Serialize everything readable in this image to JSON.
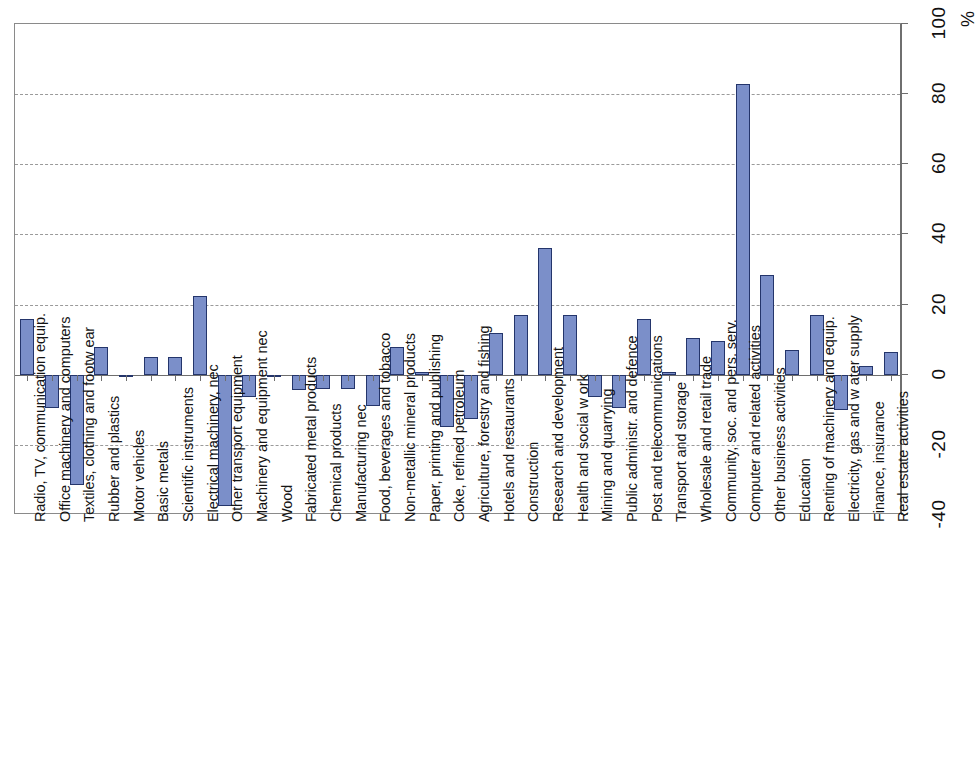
{
  "chart_data": {
    "type": "bar",
    "title": "",
    "subtitle": "",
    "xlabel": "",
    "ylabel": "%",
    "unit_label": "%",
    "ylim": [
      -40,
      100
    ],
    "ytick_values": [
      -40,
      -20,
      0,
      20,
      40,
      60,
      80,
      100
    ],
    "ytick_labels": [
      "-40",
      "-20",
      "0",
      "20",
      "40",
      "60",
      "80",
      "100"
    ],
    "grid": true,
    "grid_axis": "y",
    "legend": false,
    "legend_position": "none",
    "orientation": "vertical",
    "category_label_rotation": -90,
    "value_label_rotation": -90,
    "bar_fill_color": "#7b8fc9",
    "bar_border_color": "#24356b",
    "gridline_color": "#9a9a9a",
    "axis_color": "#6e6e6e",
    "background_color": "#ffffff",
    "categories": [
      "Radio, TV, communication equip.",
      "Office machinery and computers",
      "Textiles, clothing and footw ear",
      "Rubber and plastics",
      "Motor vehicles",
      "Basic metals",
      "Scientific instruments",
      "Electrical machinery, nec",
      "Other transport equipment",
      "Machinery and equipment nec",
      "Wood",
      "Fabricated metal products",
      "Chemical products",
      "Manufacturing nec",
      "Food, beverages and tobacco",
      "Non-metallic mineral products",
      "Paper, printing and publishing",
      "Coke, refined petroleum",
      "Agriculture, forestry and fishing",
      "Hotels and restaurants",
      "Construction",
      "Research and development",
      "Health and social w ork",
      "Mining and quarrying",
      "Public administr. and defence",
      "Post and telecommunications",
      "Transport and storage",
      "Wholesale and retail trade",
      "Community, soc. and pers. serv.",
      "Computer and related activities",
      "Other business activities",
      "Education",
      "Renting of machinery and equip.",
      "Electricity, gas and w ater supply",
      "Finance, insurance",
      "Real estate activities"
    ],
    "values": [
      16,
      -9.5,
      -31.5,
      8,
      0,
      5,
      5,
      22.5,
      -37.5,
      -6.5,
      -0.6,
      -4.5,
      -4,
      -4,
      -9,
      8,
      0.8,
      -15,
      -12.5,
      12,
      17,
      36,
      17,
      -6.5,
      -9.5,
      16,
      0.7,
      10.5,
      9.5,
      83,
      28.5,
      7,
      17,
      -10,
      2.5,
      6.5
    ]
  }
}
